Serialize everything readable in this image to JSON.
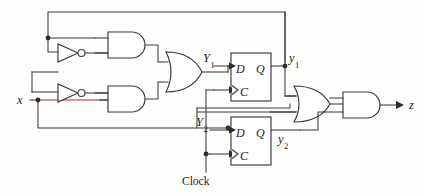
{
  "figure": {
    "type": "logic-circuit-schematic"
  },
  "signals": {
    "input_x": "x",
    "output_z": "z",
    "clock": "Clock",
    "next_state_1": "Y",
    "next_state_1_sub": "1",
    "next_state_2": "Y",
    "next_state_2_sub": "2",
    "state_1": "y",
    "state_1_sub": "1",
    "state_2": "y",
    "state_2_sub": "2"
  },
  "flipflops": [
    {
      "name": "flipflop-1",
      "d_pin": "D",
      "q_pin": "Q",
      "clk_pin": "C",
      "input_label": "Y",
      "input_sub": "1",
      "output_label": "y",
      "output_sub": "1"
    },
    {
      "name": "flipflop-2",
      "d_pin": "D",
      "q_pin": "Q",
      "clk_pin": "C",
      "input_label": "Y",
      "input_sub": "2",
      "output_label": "y",
      "output_sub": "2"
    }
  ],
  "gates": [
    {
      "name": "inverter-top",
      "type": "NOT"
    },
    {
      "name": "inverter-bottom",
      "type": "NOT"
    },
    {
      "name": "and-gate-top",
      "type": "AND"
    },
    {
      "name": "and-gate-mid",
      "type": "AND"
    },
    {
      "name": "or-gate-left",
      "type": "OR"
    },
    {
      "name": "or-gate-right",
      "type": "OR"
    },
    {
      "name": "and-gate-out",
      "type": "AND"
    }
  ],
  "colors": {
    "wire": "#3a3a3a",
    "wire_highlight": "#8c3a3a",
    "text": "#1e1e1e",
    "background": "#fdfdfc"
  }
}
